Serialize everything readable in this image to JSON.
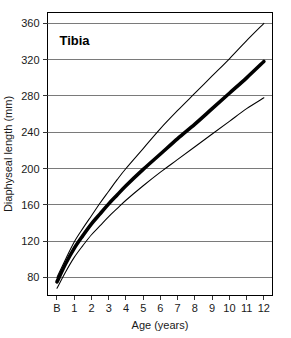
{
  "chart_data": {
    "type": "line",
    "title": "Tibia",
    "xlabel": "Age (years)",
    "ylabel": "Diaphyseal length (mm)",
    "xlim": [
      -0.55,
      12.5
    ],
    "ylim": [
      60,
      372
    ],
    "grid": true,
    "legend": "none",
    "x_tick_labels": [
      "B",
      "1",
      "2",
      "3",
      "4",
      "5",
      "6",
      "7",
      "8",
      "9",
      "10",
      "11",
      "12"
    ],
    "x_tick_values": [
      0,
      1,
      2,
      3,
      4,
      5,
      6,
      7,
      8,
      9,
      10,
      11,
      12
    ],
    "y_tick_labels": [
      "80",
      "120",
      "160",
      "200",
      "240",
      "280",
      "320",
      "360"
    ],
    "y_tick_values": [
      80,
      120,
      160,
      200,
      240,
      280,
      320,
      360
    ],
    "x": [
      0,
      0.5,
      1,
      1.5,
      2,
      2.5,
      3,
      3.5,
      4,
      5,
      6,
      7,
      8,
      9,
      10,
      11,
      12
    ],
    "series": [
      {
        "name": "+2 SD (upper percentile)",
        "style": "thin",
        "values": [
          80,
          100,
          119,
          134,
          148,
          162,
          175,
          188,
          200,
          222,
          244,
          264,
          283,
          302,
          321,
          341,
          360
        ]
      },
      {
        "name": "Mean diaphyseal length",
        "style": "thick",
        "values": [
          75,
          95,
          112,
          126,
          139,
          150,
          161,
          171,
          181,
          199,
          216,
          233,
          249,
          266,
          283,
          300,
          318
        ]
      },
      {
        "name": "-2 SD (lower percentile)",
        "style": "thin",
        "values": [
          68,
          86,
          102,
          115,
          127,
          137,
          147,
          156,
          165,
          181,
          196,
          210,
          224,
          238,
          252,
          266,
          278
        ]
      }
    ]
  },
  "axes": {
    "y_axis_title": "Diaphyseal length (mm)",
    "x_axis_title": "Age (years)"
  },
  "title": {
    "text": "Tibia"
  }
}
